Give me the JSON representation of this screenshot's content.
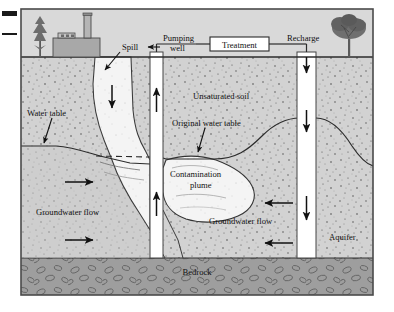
{
  "figure": {
    "surface_features": [
      "factory",
      "tree-left",
      "tree-right"
    ],
    "frame_color": "#4a4a4a",
    "sky_color": "#d9d9d9",
    "soil_color": "#d2d2d2",
    "plume_fill": "#f4f4f4",
    "bedrock_color": "#9e9e9e",
    "well_fill": "#ffffff",
    "ink": "#111111"
  },
  "labels": {
    "spill": "Spill",
    "pumping_well_line1": "Pumping",
    "pumping_well_line2": "well",
    "treatment": "Treatment",
    "recharge": "Recharge",
    "water_table": "Water table",
    "unsaturated_soil": "Unsaturated soil",
    "original_water_table": "Original water table",
    "contamination_line1": "Contamination",
    "contamination_line2": "plume",
    "groundwater_flow_left": "Groundwater flow",
    "groundwater_flow_right": "Groundwater flow",
    "aquifer": "Aquifer",
    "bedrock": "Bedrock"
  },
  "flow_arrows": [
    {
      "name": "spill-downward",
      "direction": "down"
    },
    {
      "name": "pumping-well-up-upper",
      "direction": "up"
    },
    {
      "name": "pumping-well-up-lower",
      "direction": "up"
    },
    {
      "name": "recharge-well-down-upper",
      "direction": "down"
    },
    {
      "name": "recharge-well-down-lower",
      "direction": "down"
    },
    {
      "name": "groundwater-left-upper",
      "direction": "right"
    },
    {
      "name": "groundwater-left-lower",
      "direction": "right"
    },
    {
      "name": "groundwater-right-upper",
      "direction": "left"
    },
    {
      "name": "groundwater-right-lower",
      "direction": "left"
    },
    {
      "name": "recharge-inlet-down",
      "direction": "down"
    }
  ],
  "edge_marks": [
    "crop-mark-thick",
    "crop-mark-thin"
  ]
}
